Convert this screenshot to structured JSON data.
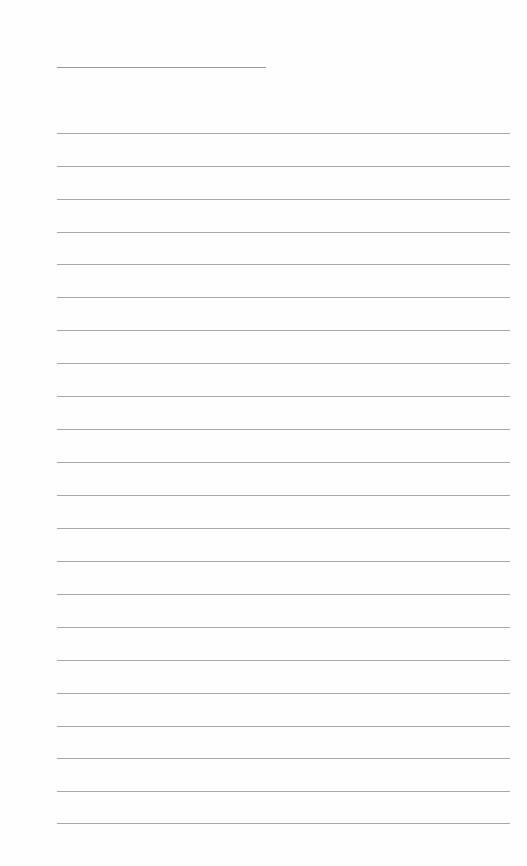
{
  "page": {
    "type": "lined-notepaper",
    "title_line": {
      "text": ""
    },
    "lines": [
      "",
      "",
      "",
      "",
      "",
      "",
      "",
      "",
      "",
      "",
      "",
      "",
      "",
      "",
      "",
      "",
      "",
      "",
      "",
      "",
      "",
      ""
    ]
  },
  "colors": {
    "background": "#ffffff",
    "rule": "#a8a8a8",
    "title_rule": "#9a9a9a"
  }
}
